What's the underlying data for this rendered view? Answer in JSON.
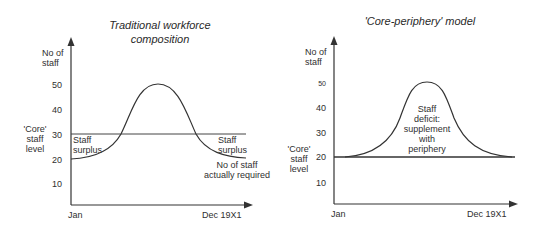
{
  "left_chart": {
    "title_line1": "Traditional workforce",
    "title_line2": "composition",
    "y_label_line1": "No of",
    "y_label_line2": "staff",
    "y_ticks": [
      "50",
      "40",
      "30",
      "20",
      "10"
    ],
    "core_label_line1": "'Core'",
    "core_label_line2": "staff",
    "core_label_line3": "level",
    "x_start": "Jan",
    "x_end": "Dec 19X1",
    "surplus_left_line1": "Staff",
    "surplus_left_line2": "surplus",
    "surplus_right_line1": "Staff",
    "surplus_right_line2": "surplus",
    "curve_label_line1": "No of staff",
    "curve_label_line2": "actually required",
    "core_level": 30
  },
  "right_chart": {
    "title": "'Core-periphery' model",
    "y_label_line1": "No of",
    "y_label_line2": "staff",
    "y_ticks": [
      "50",
      "40",
      "30",
      "20",
      "10"
    ],
    "core_label_line1": "'Core'",
    "core_label_line2": "staff",
    "core_label_line3": "level",
    "x_start": "Jan",
    "x_end": "Dec 19X1",
    "deficit_line1": "Staff",
    "deficit_line2": "deficit:",
    "deficit_line3": "supplement",
    "deficit_line4": "with",
    "deficit_line5": "periphery",
    "core_level": 20
  }
}
